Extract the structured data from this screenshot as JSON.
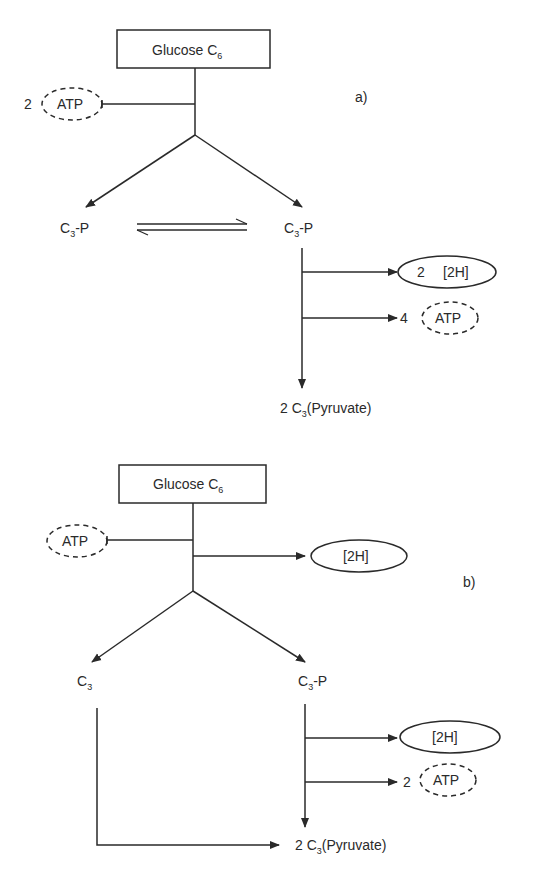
{
  "diagram_a": {
    "panel_label": "a)",
    "source": {
      "name": "Glucose C",
      "sub": "6"
    },
    "input": {
      "count": "2",
      "label": "ATP"
    },
    "left_product": {
      "name": "C",
      "sub": "3",
      "suffix": "-P"
    },
    "right_product": {
      "name": "C",
      "sub": "3",
      "suffix": "-P"
    },
    "output_1": {
      "count": "2",
      "label": "[2H]"
    },
    "output_2": {
      "count": "4",
      "label": "ATP"
    },
    "final": {
      "prefix": "2 C",
      "sub": "3",
      "suffix": "(Pyruvate)"
    }
  },
  "diagram_b": {
    "panel_label": "b)",
    "source": {
      "name": "Glucose C",
      "sub": "6"
    },
    "input": {
      "label": "ATP"
    },
    "side_output": {
      "label": "[2H]"
    },
    "left_product": {
      "name": "C",
      "sub": "3"
    },
    "right_product": {
      "name": "C",
      "sub": "3",
      "suffix": "-P"
    },
    "output_1": {
      "label": "[2H]"
    },
    "output_2": {
      "count": "2",
      "label": "ATP"
    },
    "final": {
      "prefix": "2 C",
      "sub": "3",
      "suffix": "(Pyruvate)"
    }
  }
}
